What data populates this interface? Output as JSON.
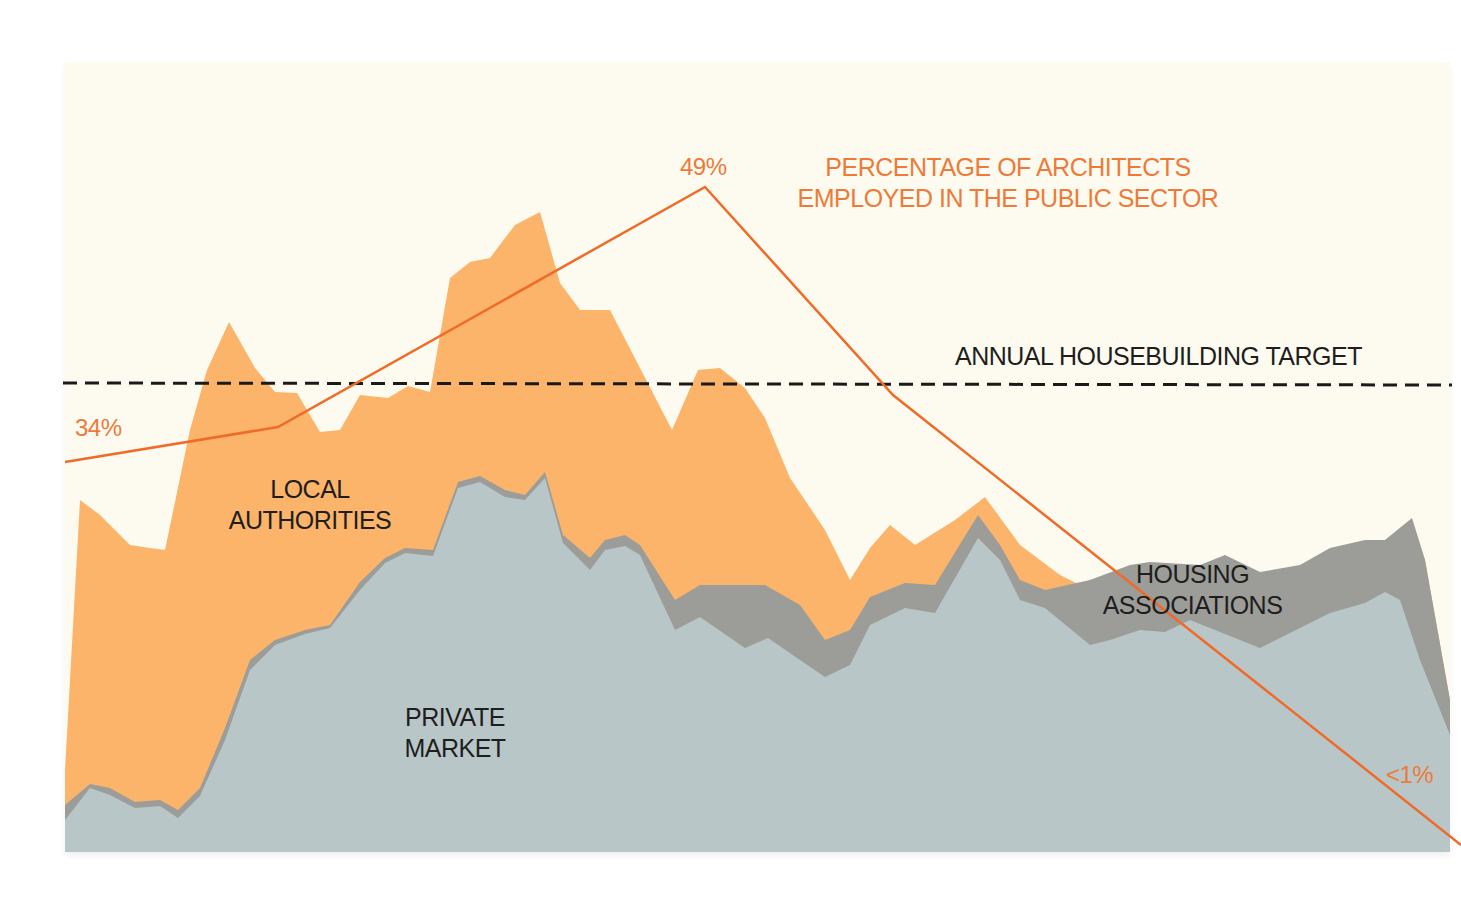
{
  "chart_data": {
    "type": "area",
    "subtype": "stacked-area-with-line-overlay",
    "title": "",
    "xlabel": "",
    "ylabel": "",
    "grid": false,
    "legend_position": "inline-labels",
    "colors": {
      "background": "#fdfbf0",
      "private_market": "#b9c6c8",
      "housing_associations": "#9c9c98",
      "local_authorities": "#fbb46a",
      "public_sector_line": "#f06a28",
      "target_line": "#1a1a1a",
      "annotation_orange": "#ee7a3a",
      "label_dark": "#1e1e1e"
    },
    "series": [
      {
        "name": "PRIVATE MARKET",
        "label_lines": [
          "PRIVATE",
          "MARKET"
        ],
        "points_px": [
          [
            65,
            820
          ],
          [
            90,
            788
          ],
          [
            110,
            795
          ],
          [
            135,
            808
          ],
          [
            160,
            806
          ],
          [
            178,
            818
          ],
          [
            200,
            796
          ],
          [
            225,
            740
          ],
          [
            250,
            670
          ],
          [
            275,
            645
          ],
          [
            305,
            634
          ],
          [
            330,
            628
          ],
          [
            360,
            590
          ],
          [
            385,
            563
          ],
          [
            405,
            553
          ],
          [
            433,
            556
          ],
          [
            458,
            488
          ],
          [
            480,
            482
          ],
          [
            505,
            497
          ],
          [
            525,
            500
          ],
          [
            545,
            478
          ],
          [
            563,
            543
          ],
          [
            590,
            570
          ],
          [
            605,
            550
          ],
          [
            625,
            546
          ],
          [
            640,
            555
          ],
          [
            675,
            630
          ],
          [
            700,
            617
          ],
          [
            745,
            648
          ],
          [
            768,
            638
          ],
          [
            800,
            660
          ],
          [
            825,
            677
          ],
          [
            850,
            665
          ],
          [
            870,
            625
          ],
          [
            905,
            608
          ],
          [
            935,
            613
          ],
          [
            978,
            538
          ],
          [
            1000,
            560
          ],
          [
            1020,
            600
          ],
          [
            1045,
            608
          ],
          [
            1090,
            645
          ],
          [
            1110,
            640
          ],
          [
            1140,
            630
          ],
          [
            1165,
            632
          ],
          [
            1190,
            620
          ],
          [
            1215,
            630
          ],
          [
            1260,
            648
          ],
          [
            1300,
            628
          ],
          [
            1330,
            613
          ],
          [
            1365,
            603
          ],
          [
            1385,
            592
          ],
          [
            1400,
            600
          ],
          [
            1420,
            660
          ],
          [
            1450,
            735
          ]
        ]
      },
      {
        "name": "HOUSING ASSOCIATIONS",
        "label_lines": [
          "HOUSING",
          "ASSOCIATIONS"
        ],
        "points_px": [
          [
            65,
            805
          ],
          [
            90,
            784
          ],
          [
            110,
            788
          ],
          [
            135,
            802
          ],
          [
            160,
            800
          ],
          [
            178,
            810
          ],
          [
            200,
            788
          ],
          [
            225,
            728
          ],
          [
            250,
            660
          ],
          [
            275,
            640
          ],
          [
            305,
            630
          ],
          [
            330,
            625
          ],
          [
            360,
            582
          ],
          [
            385,
            558
          ],
          [
            405,
            548
          ],
          [
            433,
            550
          ],
          [
            458,
            482
          ],
          [
            480,
            476
          ],
          [
            505,
            490
          ],
          [
            525,
            495
          ],
          [
            545,
            472
          ],
          [
            563,
            535
          ],
          [
            590,
            558
          ],
          [
            605,
            540
          ],
          [
            625,
            535
          ],
          [
            640,
            545
          ],
          [
            675,
            600
          ],
          [
            700,
            585
          ],
          [
            765,
            585
          ],
          [
            800,
            605
          ],
          [
            825,
            640
          ],
          [
            850,
            630
          ],
          [
            870,
            597
          ],
          [
            905,
            583
          ],
          [
            935,
            585
          ],
          [
            978,
            515
          ],
          [
            1000,
            545
          ],
          [
            1020,
            580
          ],
          [
            1045,
            590
          ],
          [
            1090,
            580
          ],
          [
            1130,
            565
          ],
          [
            1150,
            562
          ],
          [
            1200,
            565
          ],
          [
            1225,
            555
          ],
          [
            1260,
            572
          ],
          [
            1300,
            565
          ],
          [
            1330,
            548
          ],
          [
            1365,
            540
          ],
          [
            1385,
            540
          ],
          [
            1412,
            518
          ],
          [
            1425,
            560
          ],
          [
            1450,
            700
          ]
        ]
      },
      {
        "name": "LOCAL AUTHORITIES",
        "label_lines": [
          "LOCAL",
          "AUTHORITIES"
        ],
        "points_px": [
          [
            65,
            770
          ],
          [
            80,
            500
          ],
          [
            100,
            515
          ],
          [
            130,
            545
          ],
          [
            150,
            548
          ],
          [
            165,
            550
          ],
          [
            190,
            430
          ],
          [
            207,
            370
          ],
          [
            229,
            322
          ],
          [
            255,
            368
          ],
          [
            275,
            392
          ],
          [
            297,
            393
          ],
          [
            320,
            432
          ],
          [
            340,
            430
          ],
          [
            360,
            395
          ],
          [
            388,
            398
          ],
          [
            408,
            386
          ],
          [
            430,
            392
          ],
          [
            450,
            278
          ],
          [
            470,
            262
          ],
          [
            490,
            258
          ],
          [
            515,
            225
          ],
          [
            540,
            212
          ],
          [
            560,
            283
          ],
          [
            580,
            310
          ],
          [
            610,
            310
          ],
          [
            672,
            430
          ],
          [
            698,
            370
          ],
          [
            720,
            368
          ],
          [
            745,
            388
          ],
          [
            765,
            418
          ],
          [
            790,
            478
          ],
          [
            825,
            530
          ],
          [
            850,
            580
          ],
          [
            870,
            548
          ],
          [
            890,
            525
          ],
          [
            915,
            545
          ],
          [
            955,
            520
          ],
          [
            985,
            497
          ],
          [
            1020,
            545
          ],
          [
            1060,
            575
          ],
          [
            1090,
            590
          ],
          [
            1130,
            600
          ],
          [
            1200,
            600
          ],
          [
            1260,
            620
          ],
          [
            1300,
            600
          ],
          [
            1330,
            585
          ],
          [
            1365,
            575
          ],
          [
            1385,
            560
          ],
          [
            1412,
            520
          ],
          [
            1425,
            560
          ],
          [
            1450,
            700
          ]
        ]
      },
      {
        "name": "PERCENTAGE OF ARCHITECTS EMPLOYED IN THE PUBLIC SECTOR",
        "type": "line",
        "label_lines": [
          "PERCENTAGE OF ARCHITECTS",
          "EMPLOYED IN THE PUBLIC SECTOR"
        ],
        "points_px": [
          [
            65,
            462
          ],
          [
            278,
            427
          ],
          [
            705,
            187
          ],
          [
            893,
            395
          ],
          [
            1335,
            745
          ],
          [
            1461,
            845
          ]
        ],
        "annotated_values": [
          {
            "label": "34%",
            "value": 34,
            "position": "start"
          },
          {
            "label": "49%",
            "value": 49,
            "position": "peak"
          },
          {
            "label": "<1%",
            "value": 1,
            "position": "end"
          }
        ]
      }
    ],
    "reference_lines": [
      {
        "name": "ANNUAL HOUSEBUILDING TARGET",
        "style": "dashed",
        "y_px": 383
      }
    ],
    "annotations": {
      "start_pct": "34%",
      "peak_pct": "49%",
      "end_pct": "<1%",
      "line_title_1": "PERCENTAGE OF ARCHITECTS",
      "line_title_2": "EMPLOYED IN THE PUBLIC SECTOR",
      "target_label": "ANNUAL HOUSEBUILDING TARGET",
      "local_1": "LOCAL",
      "local_2": "AUTHORITIES",
      "private_1": "PRIVATE",
      "private_2": "MARKET",
      "housing_1": "HOUSING",
      "housing_2": "ASSOCIATIONS"
    }
  }
}
